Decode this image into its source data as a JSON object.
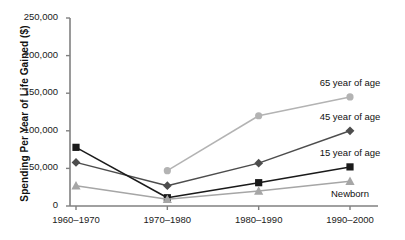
{
  "chart_data": {
    "type": "line",
    "title": "",
    "xlabel": "",
    "ylabel": "Spending Per Year of Life Gained ($)",
    "categories": [
      "1960–1970",
      "1970–1980",
      "1980–1990",
      "1990–2000"
    ],
    "ylim": [
      0,
      250000
    ],
    "yticks": [
      0,
      50000,
      100000,
      150000,
      200000,
      250000
    ],
    "ytick_labels": [
      "0",
      "50,000",
      "100,000",
      "150,000",
      "200,000",
      "250,000"
    ],
    "grid": false,
    "legend_position": "right-inline-labels",
    "series": [
      {
        "name": "65 year of age",
        "marker": "circle",
        "color": "#b3b3b3",
        "values": [
          null,
          47000,
          120000,
          145000
        ]
      },
      {
        "name": "45 year of age",
        "marker": "diamond",
        "color": "#4d4d4d",
        "values": [
          58000,
          27000,
          57000,
          100000
        ]
      },
      {
        "name": "15 year of age",
        "marker": "square",
        "color": "#1a1a1a",
        "values": [
          78000,
          11000,
          31000,
          52000
        ]
      },
      {
        "name": "Newborn",
        "marker": "triangle",
        "color": "#a6a6a6",
        "values": [
          27000,
          9000,
          20000,
          33000
        ]
      }
    ]
  },
  "axis": {
    "line_color": "#808080"
  }
}
